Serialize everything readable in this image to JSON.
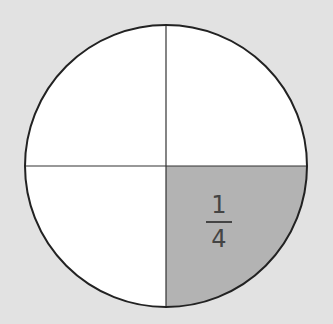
{
  "diagram": {
    "type": "fraction-circle",
    "parts": 4,
    "shaded_parts": 1,
    "shaded_quadrant": "bottom-right",
    "label": {
      "numerator": "1",
      "denominator": "4"
    },
    "colors": {
      "background": "#e2e2e2",
      "fill": "#ffffff",
      "shaded": "#b3b3b3",
      "stroke": "#222222"
    }
  }
}
